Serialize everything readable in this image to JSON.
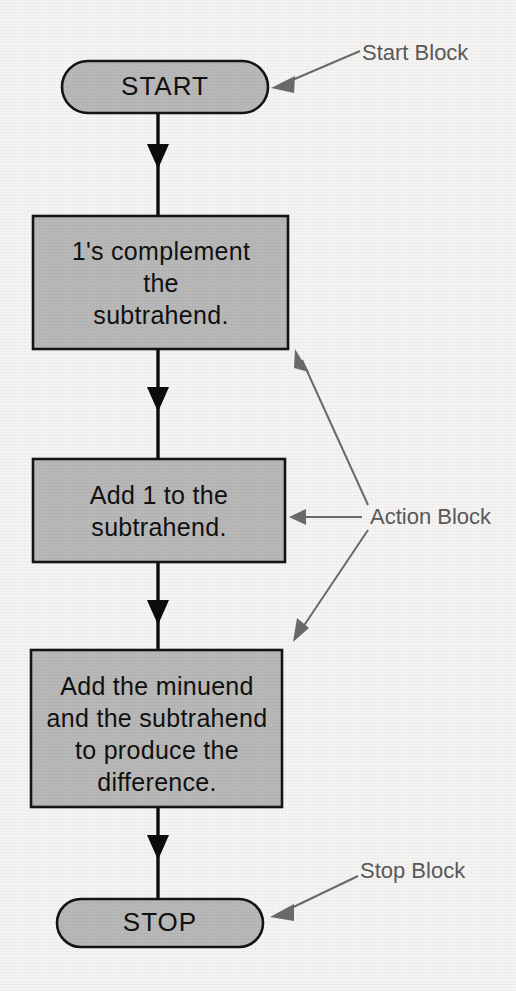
{
  "diagram": {
    "type": "flowchart",
    "colors": {
      "background": "#f6f5f3",
      "shape_fill": "#b9b9b9",
      "shape_stroke": "#141414",
      "flow_line": "#0d0d0d",
      "annotation": "#6b6b6b"
    },
    "nodes": [
      {
        "id": "start",
        "shape": "terminal",
        "label": "START",
        "lines": [
          "START"
        ]
      },
      {
        "id": "action-1",
        "shape": "process",
        "label": "1's complement the subtrahend.",
        "lines": [
          "1's complement",
          "the",
          "subtrahend."
        ]
      },
      {
        "id": "action-2",
        "shape": "process",
        "label": "Add 1 to the subtrahend.",
        "lines": [
          "Add 1 to the",
          "subtrahend."
        ]
      },
      {
        "id": "action-3",
        "shape": "process",
        "label": "Add the minuend and the subtrahend to produce the difference.",
        "lines": [
          "Add the minuend",
          "and the subtrahend",
          "to produce the",
          "difference."
        ]
      },
      {
        "id": "stop",
        "shape": "terminal",
        "label": "STOP",
        "lines": [
          "STOP"
        ]
      }
    ],
    "edges": [
      {
        "from": "start",
        "to": "action-1"
      },
      {
        "from": "action-1",
        "to": "action-2"
      },
      {
        "from": "action-2",
        "to": "action-3"
      },
      {
        "from": "action-3",
        "to": "stop"
      }
    ],
    "annotations": [
      {
        "id": "start-block",
        "label": "Start Block",
        "points_to": [
          "start"
        ]
      },
      {
        "id": "action-block",
        "label": "Action Block",
        "points_to": [
          "action-1",
          "action-2",
          "action-3"
        ]
      },
      {
        "id": "stop-block",
        "label": "Stop Block",
        "points_to": [
          "stop"
        ]
      }
    ]
  }
}
